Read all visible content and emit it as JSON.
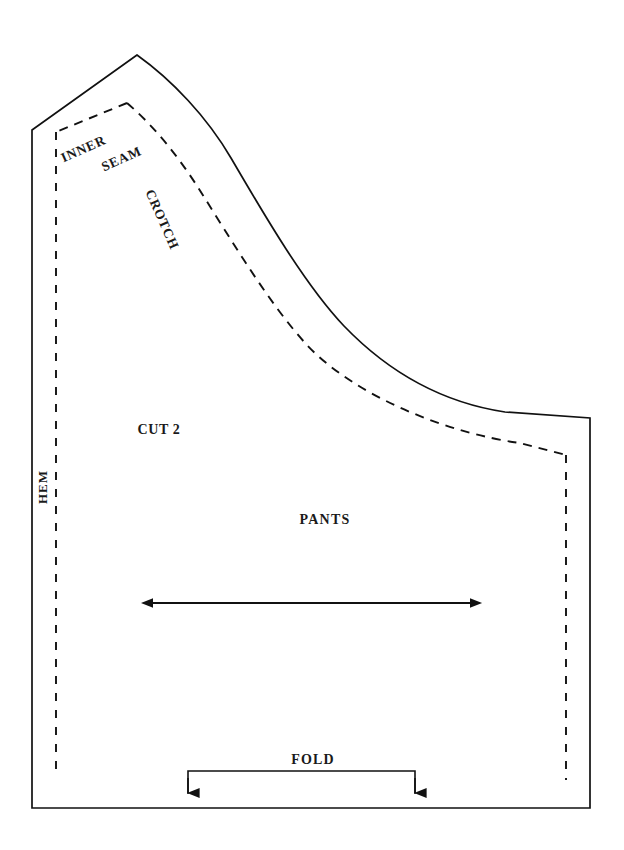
{
  "document": {
    "kind": "sewing-pattern-diagram",
    "title": "Pants Pattern Piece",
    "background_color": "#ffffff",
    "line_color": "#111111"
  },
  "labels": {
    "cut_quantity": "CUT 2",
    "piece_name": "PANTS",
    "fold": "FOLD",
    "hem": "HEM",
    "inner": "INNER",
    "seam": "SEAM",
    "crotch": "CROTCH"
  },
  "markings": {
    "grainline": {
      "name": "grainline-arrow",
      "style": "double-headed-arrow",
      "x_start": 153,
      "x_end": 470,
      "y": 603
    },
    "fold_bracket": {
      "name": "fold-bracket",
      "style": "bracket-with-down-arrows",
      "x_left": 188,
      "x_right": 415,
      "y_bar": 771,
      "y_arrow_tip": 794
    },
    "hem_line": {
      "name": "hem-seam-allowance-line",
      "style": "dashed-vertical",
      "x": 56,
      "y_top": 132,
      "y_bottom": 778
    }
  },
  "geometry": {
    "cut_line_path": "M 137 55 L 32 130 L 32 808 L 590 808 L 590 418 L 505 412 C 450 404 392 381 340 324 C 300 280 258 208 224 151 C 200 111 170 78 137 55 Z",
    "seam_line_path": "M 127 103 L 55 132 L 55 778 M 127 103 C 156 127 182 160 203 193 C 236 244 272 304 310 344 C 360 396 450 432 520 442 L 566 455 L 566 780",
    "apex": [
      137,
      55
    ],
    "top_left_corner": [
      32,
      130
    ],
    "bottom_left_corner": [
      32,
      808
    ],
    "bottom_right_corner": [
      590,
      808
    ],
    "right_top_corner": [
      590,
      418
    ],
    "seam_apex": [
      127,
      103
    ],
    "seam_right_corner": [
      566,
      455
    ]
  },
  "label_positions": {
    "cut_quantity": {
      "x": 159,
      "y": 431,
      "rotate": 0
    },
    "piece_name": {
      "x": 325,
      "y": 521,
      "rotate": 0
    },
    "fold": {
      "x": 313,
      "y": 761,
      "rotate": 0
    },
    "hem": {
      "x": 44,
      "y": 487,
      "rotate": -90
    },
    "inner": {
      "x": 84,
      "y": 150,
      "rotate": -24
    },
    "seam": {
      "x": 121,
      "y": 159,
      "rotate": -24
    },
    "crotch": {
      "x": 160,
      "y": 219,
      "rotate": 66
    }
  }
}
